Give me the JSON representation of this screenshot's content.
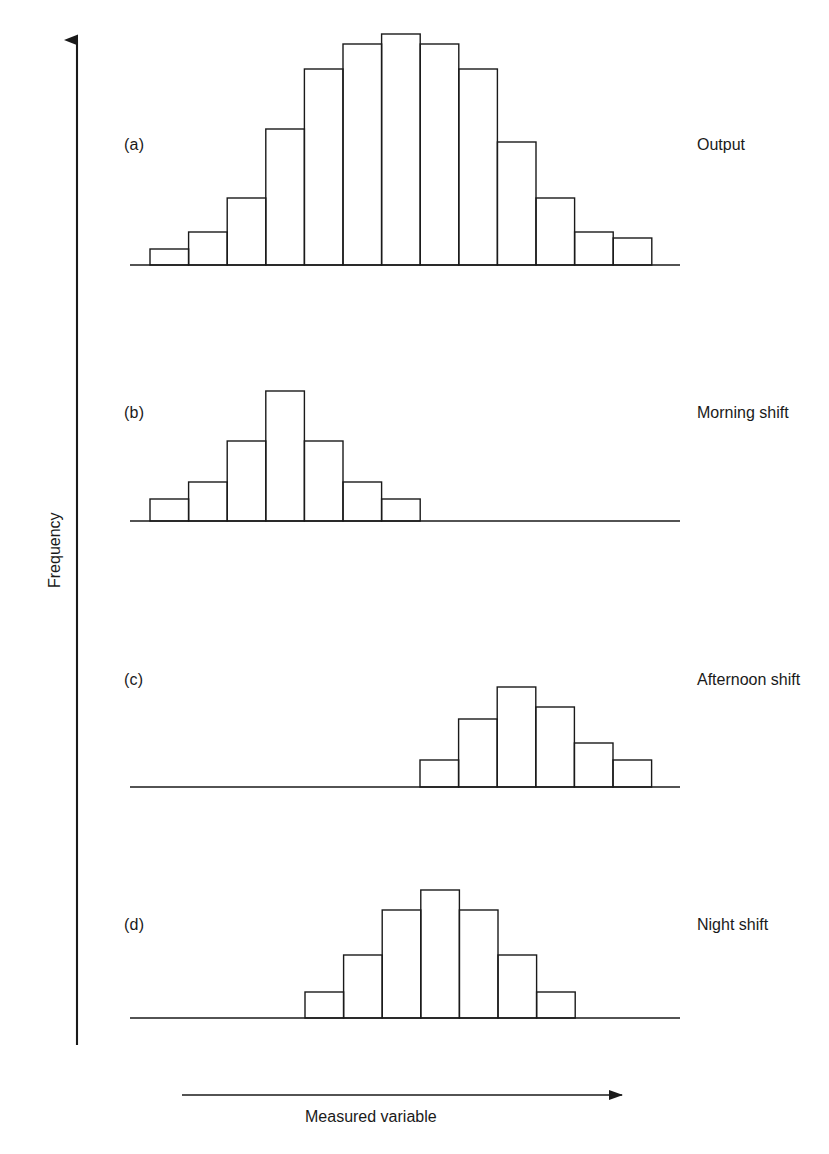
{
  "figure": {
    "axis_y_label": "Frequency",
    "axis_x_label": "Measured variable",
    "line_color": "#1a1a1a",
    "background_color": "#ffffff"
  },
  "panels": [
    {
      "tag": "(a)",
      "label": "Output"
    },
    {
      "tag": "(b)",
      "label": "Morning shift"
    },
    {
      "tag": "(c)",
      "label": "Afternoon shift"
    },
    {
      "tag": "(d)",
      "label": "Night shift"
    }
  ],
  "chart_data": [
    {
      "type": "bar",
      "title": "Output",
      "panel": "(a)",
      "xlabel": "Measured variable",
      "ylabel": "Frequency",
      "grid": false,
      "legend": "none",
      "bin_count": 13,
      "categories": [
        "1",
        "2",
        "3",
        "4",
        "5",
        "6",
        "7",
        "8",
        "9",
        "10",
        "11",
        "12",
        "13"
      ],
      "values": [
        16,
        33,
        67,
        136,
        196,
        221,
        231,
        221,
        196,
        123,
        67,
        33,
        27
      ],
      "ylim": [
        0,
        240
      ],
      "note": "Combined distribution of all three shifts; approximately symmetric bell shape"
    },
    {
      "type": "bar",
      "title": "Morning shift",
      "panel": "(b)",
      "xlabel": "Measured variable",
      "ylabel": "Frequency",
      "grid": false,
      "legend": "none",
      "bin_count": 7,
      "categories": [
        "1",
        "2",
        "3",
        "4",
        "5",
        "6",
        "7"
      ],
      "values": [
        22,
        39,
        80,
        130,
        80,
        39,
        22
      ],
      "ylim": [
        0,
        240
      ],
      "note": "Narrow symmetric distribution positioned at the low end of the measured variable"
    },
    {
      "type": "bar",
      "title": "Afternoon shift",
      "panel": "(c)",
      "xlabel": "Measured variable",
      "ylabel": "Frequency",
      "grid": false,
      "legend": "none",
      "bin_count": 6,
      "categories": [
        "1",
        "2",
        "3",
        "4",
        "5",
        "6"
      ],
      "values": [
        27,
        68,
        100,
        80,
        44,
        27
      ],
      "ylim": [
        0,
        240
      ],
      "note": "Distribution shifted toward the high end of the measured variable"
    },
    {
      "type": "bar",
      "title": "Night shift",
      "panel": "(d)",
      "xlabel": "Measured variable",
      "ylabel": "Frequency",
      "grid": false,
      "legend": "none",
      "bin_count": 7,
      "categories": [
        "1",
        "2",
        "3",
        "4",
        "5",
        "6",
        "7"
      ],
      "values": [
        26,
        63,
        108,
        128,
        108,
        63,
        26
      ],
      "ylim": [
        0,
        240
      ],
      "note": "Symmetric distribution centred in the middle of the measured variable range"
    }
  ],
  "geometry": {
    "bar_width": 38.6,
    "panel_baselines": [
      265,
      521,
      787,
      1018
    ],
    "panel_bar_start_x": [
      150,
      150,
      420,
      305
    ],
    "panel_axis_span": [
      [
        130,
        680
      ],
      [
        130,
        680
      ],
      [
        130,
        680
      ],
      [
        130,
        680
      ]
    ],
    "y_axis_x": 77,
    "y_axis_top": 28,
    "y_axis_bottom": 1045,
    "x_arrow": {
      "x1": 182,
      "x2": 628,
      "y": 1095
    }
  }
}
